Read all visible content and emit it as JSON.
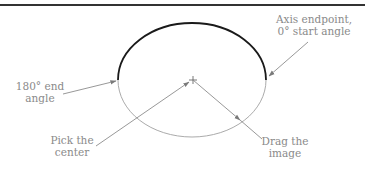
{
  "figure": {
    "type": "elliptical-arc construction diagram",
    "labels": {
      "axis_endpoint": "Axis endpoint,\n0° start angle",
      "end_angle": "180° end\nangle",
      "pick_center": "Pick the\ncenter",
      "drag_image": "Drag the\nimage"
    },
    "colors": {
      "arc": "#1a1a1a",
      "ellipse_guide": "#9a9a9a",
      "leader": "#8c8c8c",
      "text": "#8a8a8a",
      "rule": "#333333"
    }
  }
}
